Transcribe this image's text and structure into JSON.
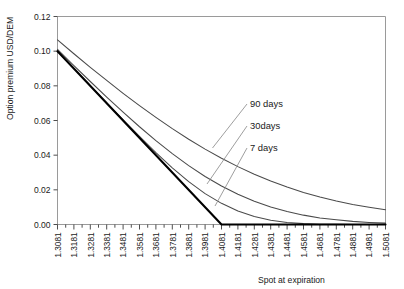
{
  "chart_data": {
    "type": "line",
    "title": "",
    "xlabel": "Spot at expiration",
    "ylabel": "Option premium USD/DEM",
    "xlim": [
      1.3081,
      1.5081
    ],
    "ylim": [
      0.0,
      0.12
    ],
    "grid": false,
    "legend_position": "inline-annotations",
    "y_ticks": [
      "0.00",
      "0.02",
      "0.04",
      "0.06",
      "0.08",
      "0.10",
      "0.12"
    ],
    "y_tick_values": [
      0.0,
      0.02,
      0.04,
      0.06,
      0.08,
      0.1,
      0.12
    ],
    "x_ticks": [
      "1.3081",
      "1.3181",
      "1.3281",
      "1.3381",
      "1.3481",
      "1.3581",
      "1.3681",
      "1.3781",
      "1.3881",
      "1.3981",
      "1.4081",
      "1.4181",
      "1.4281",
      "1.4381",
      "1.4481",
      "1.4581",
      "1.4681",
      "1.4781",
      "1.4881",
      "1.4981",
      "1.5081"
    ],
    "x_tick_values": [
      1.3081,
      1.3181,
      1.3281,
      1.3381,
      1.3481,
      1.3581,
      1.3681,
      1.3781,
      1.3881,
      1.3981,
      1.4081,
      1.4181,
      1.4281,
      1.4381,
      1.4481,
      1.4581,
      1.4681,
      1.4781,
      1.4881,
      1.4981,
      1.5081
    ],
    "strike": 1.4081,
    "annotations": [
      {
        "label": "90 days",
        "x": 1.4581,
        "y": 0.0715
      },
      {
        "label": "30days",
        "x": 1.4581,
        "y": 0.0535
      },
      {
        "label": "7 days",
        "x": 1.4581,
        "y": 0.039
      }
    ],
    "series": [
      {
        "name": "90 days",
        "color": "#4a4a4a",
        "x": [
          1.3081,
          1.3181,
          1.3281,
          1.3381,
          1.3481,
          1.3581,
          1.3681,
          1.3781,
          1.3881,
          1.3981,
          1.4081,
          1.4181,
          1.4281,
          1.4381,
          1.4481,
          1.4581,
          1.4681,
          1.4781,
          1.4881,
          1.4981,
          1.5081
        ],
        "values": [
          0.1065,
          0.0985,
          0.0907,
          0.0831,
          0.0757,
          0.0686,
          0.0618,
          0.0553,
          0.0492,
          0.0435,
          0.0382,
          0.0334,
          0.029,
          0.0251,
          0.0216,
          0.0185,
          0.0158,
          0.0135,
          0.0115,
          0.0099,
          0.0085
        ]
      },
      {
        "name": "30 days",
        "color": "#4a4a4a",
        "x": [
          1.3081,
          1.3181,
          1.3281,
          1.3381,
          1.3481,
          1.3581,
          1.3681,
          1.3781,
          1.3881,
          1.3981,
          1.4081,
          1.4181,
          1.4281,
          1.4381,
          1.4481,
          1.4581,
          1.4681,
          1.4781,
          1.4881,
          1.4981,
          1.5081
        ],
        "values": [
          0.101,
          0.0917,
          0.0825,
          0.0735,
          0.0648,
          0.0564,
          0.0484,
          0.0409,
          0.034,
          0.0277,
          0.0222,
          0.0174,
          0.0134,
          0.0101,
          0.0075,
          0.0054,
          0.0038,
          0.0027,
          0.0018,
          0.0012,
          0.0008
        ]
      },
      {
        "name": "7 days",
        "color": "#4a4a4a",
        "x": [
          1.3081,
          1.3181,
          1.3281,
          1.3381,
          1.3481,
          1.3581,
          1.3681,
          1.3781,
          1.3881,
          1.3981,
          1.4081,
          1.4181,
          1.4281,
          1.4381,
          1.4481,
          1.4581,
          1.4681,
          1.4781,
          1.4881,
          1.4981,
          1.5081
        ],
        "values": [
          0.1,
          0.09,
          0.0801,
          0.0702,
          0.0604,
          0.0508,
          0.0415,
          0.0327,
          0.0247,
          0.0178,
          0.0122,
          0.0078,
          0.0046,
          0.0025,
          0.0012,
          0.0005,
          0.0002,
          0.0001,
          0.0,
          0.0,
          0.0
        ]
      },
      {
        "name": "intrinsic value",
        "color": "#000000",
        "x": [
          1.3081,
          1.4081,
          1.5081
        ],
        "values": [
          0.1,
          0.0,
          0.0
        ]
      }
    ]
  }
}
